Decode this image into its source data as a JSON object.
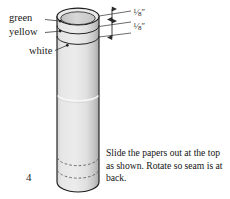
{
  "figure": {
    "number": "4",
    "caption": "Slide the papers out at the top as shown. Rotate so seam is at back."
  },
  "labels": {
    "green": "green",
    "yellow": "yellow",
    "white": "white"
  },
  "dimensions": {
    "top": {
      "numerator": "1",
      "slash": "⁄",
      "denominator": "8",
      "unit": "″"
    },
    "bottom": {
      "numerator": "1",
      "slash": "⁄",
      "denominator": "8",
      "unit": "″"
    }
  },
  "colors": {
    "background": "#ffffff",
    "tube_fill": "#e3e3e3",
    "tube_shade": "#bdbdbd",
    "tube_outline": "#1c1c1c",
    "inner_fill": "#d2d2d2",
    "leader_line": "#3a3a3a",
    "text": "#141414"
  }
}
